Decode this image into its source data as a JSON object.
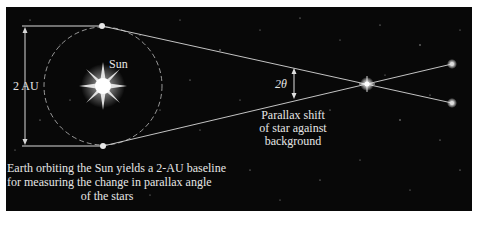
{
  "diagram": {
    "labels": {
      "sun": "Sun",
      "baseline": "2 AU",
      "angle": "2θ",
      "parallax_line1": "Parallax shift",
      "parallax_line2": "of star against",
      "parallax_line3": "background",
      "caption_line1": "Earth orbiting the Sun yields a 2-AU baseline",
      "caption_line2": "for measuring the change in parallax angle",
      "caption_line3": "of the stars"
    },
    "colors": {
      "background": "#080808",
      "lines": "#d8d8d8",
      "text": "#e6e6e6",
      "sun_glow": "#ffffff"
    },
    "nodes": {
      "sun": {
        "x": 103,
        "y": 86
      },
      "earth_top": {
        "x": 102,
        "y": 26
      },
      "earth_bottom": {
        "x": 103,
        "y": 146
      },
      "near_star": {
        "x": 367,
        "y": 84
      },
      "far_star_top": {
        "x": 452,
        "y": 64
      },
      "far_star_bottom": {
        "x": 452,
        "y": 103
      }
    },
    "orbit": {
      "cx": 103,
      "cy": 86,
      "r": 59
    }
  }
}
